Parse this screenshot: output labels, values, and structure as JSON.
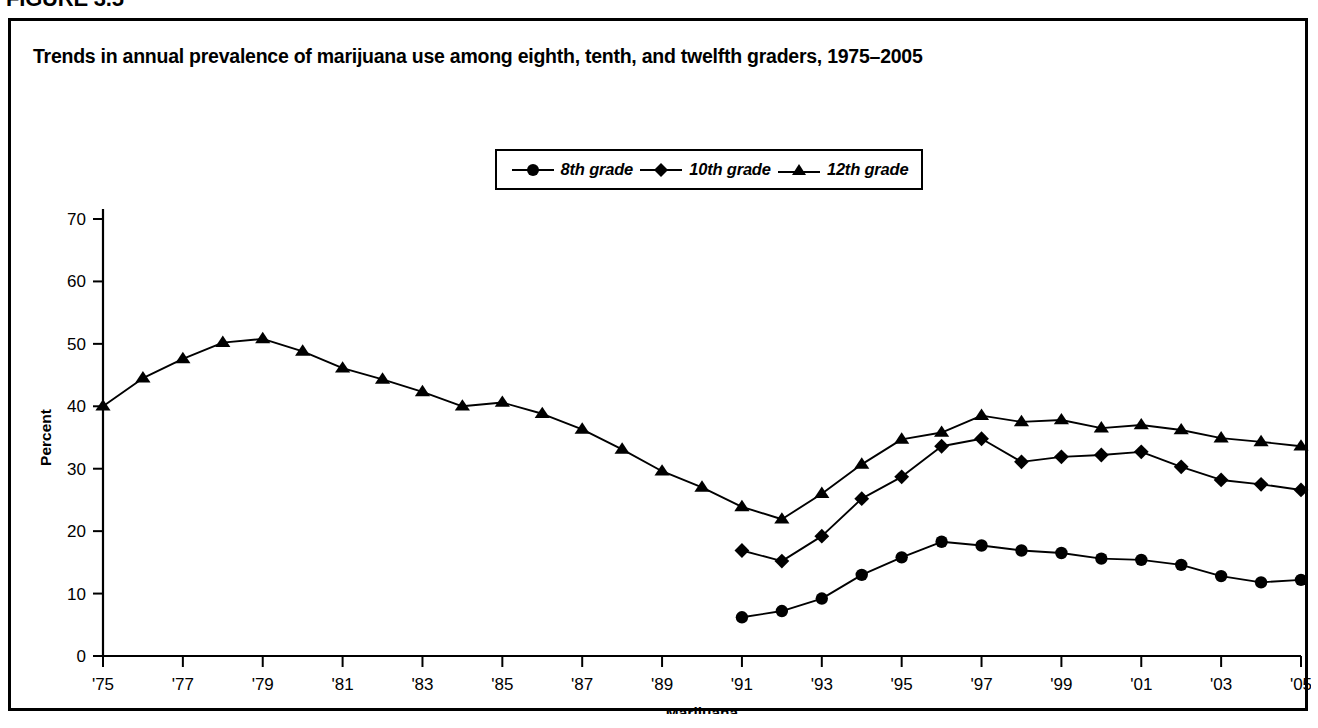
{
  "figure": {
    "caption": "FIGURE 3.5"
  },
  "chart_title": "Trends in annual prevalence of marijuana use among eighth, tenth, and twelfth graders, 1975–2005",
  "legend": {
    "items": [
      {
        "label": "8th grade",
        "marker": "circle-marker-icon"
      },
      {
        "label": "10th grade",
        "marker": "diamond-marker-icon"
      },
      {
        "label": "12th grade",
        "marker": "triangle-marker-icon"
      }
    ]
  },
  "axes": {
    "y_label": "Percent",
    "x_label": "Marijuana",
    "y_ticks": [
      "0",
      "10",
      "20",
      "30",
      "40",
      "50",
      "60",
      "70"
    ],
    "x_ticks": [
      "'75",
      "'77",
      "'79",
      "'81",
      "'83",
      "'85",
      "'87",
      "'89",
      "'91",
      "'93",
      "'95",
      "'97",
      "'99",
      "'01",
      "'03",
      "'05"
    ]
  },
  "chart_data": {
    "type": "line",
    "title": "Trends in annual prevalence of marijuana use among eighth, tenth, and twelfth graders, 1975–2005",
    "xlabel": "Marijuana",
    "ylabel": "Percent",
    "ylim": [
      0,
      70
    ],
    "xlim": [
      1975,
      2005
    ],
    "grid": false,
    "legend_position": "top-center",
    "x": [
      1975,
      1976,
      1977,
      1978,
      1979,
      1980,
      1981,
      1982,
      1983,
      1984,
      1985,
      1986,
      1987,
      1988,
      1989,
      1990,
      1991,
      1992,
      1993,
      1994,
      1995,
      1996,
      1997,
      1998,
      1999,
      2000,
      2001,
      2002,
      2003,
      2004,
      2005
    ],
    "x_tick_labels": [
      "'75",
      "'77",
      "'79",
      "'81",
      "'83",
      "'85",
      "'87",
      "'89",
      "'91",
      "'93",
      "'95",
      "'97",
      "'99",
      "'01",
      "'03",
      "'05"
    ],
    "x_tick_values": [
      1975,
      1977,
      1979,
      1981,
      1983,
      1985,
      1987,
      1989,
      1991,
      1993,
      1995,
      1997,
      1999,
      2001,
      2003,
      2005
    ],
    "y_ticks": [
      0,
      10,
      20,
      30,
      40,
      50,
      60,
      70
    ],
    "series": [
      {
        "name": "8th grade",
        "marker": "circle",
        "x": [
          1991,
          1992,
          1993,
          1994,
          1995,
          1996,
          1997,
          1998,
          1999,
          2000,
          2001,
          2002,
          2003,
          2004,
          2005
        ],
        "values": [
          6.2,
          7.2,
          9.2,
          13.0,
          15.8,
          18.3,
          17.7,
          16.9,
          16.5,
          15.6,
          15.4,
          14.6,
          12.8,
          11.8,
          12.2
        ]
      },
      {
        "name": "10th grade",
        "marker": "diamond",
        "x": [
          1991,
          1992,
          1993,
          1994,
          1995,
          1996,
          1997,
          1998,
          1999,
          2000,
          2001,
          2002,
          2003,
          2004,
          2005
        ],
        "values": [
          16.9,
          15.2,
          19.2,
          25.2,
          28.7,
          33.6,
          34.8,
          31.1,
          31.9,
          32.2,
          32.7,
          30.3,
          28.2,
          27.5,
          26.6
        ]
      },
      {
        "name": "12th grade",
        "marker": "triangle",
        "x": [
          1975,
          1976,
          1977,
          1978,
          1979,
          1980,
          1981,
          1982,
          1983,
          1984,
          1985,
          1986,
          1987,
          1988,
          1989,
          1990,
          1991,
          1992,
          1993,
          1994,
          1995,
          1996,
          1997,
          1998,
          1999,
          2000,
          2001,
          2002,
          2003,
          2004,
          2005
        ],
        "values": [
          40.0,
          44.5,
          47.6,
          50.2,
          50.8,
          48.8,
          46.1,
          44.3,
          42.3,
          40.0,
          40.6,
          38.8,
          36.3,
          33.1,
          29.6,
          27.0,
          23.9,
          21.9,
          26.0,
          30.7,
          34.7,
          35.8,
          38.5,
          37.5,
          37.8,
          36.5,
          37.0,
          36.2,
          34.9,
          34.3,
          33.6
        ]
      }
    ]
  }
}
